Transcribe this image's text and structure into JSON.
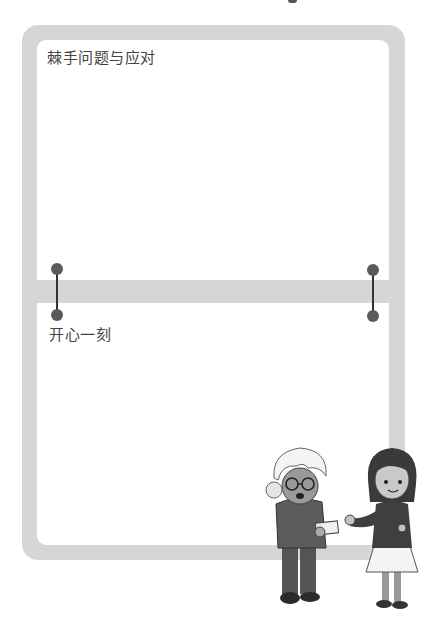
{
  "page": {
    "background": "#ffffff",
    "frame_color": "#d6d6d6",
    "connector_color": "#5a5a5a"
  },
  "sections": [
    {
      "title": "棘手问题与应对"
    },
    {
      "title": "开心一刻"
    }
  ],
  "illustration": {
    "figures": [
      "elderly-woman-with-glasses",
      "girl-with-bob-hair"
    ]
  }
}
